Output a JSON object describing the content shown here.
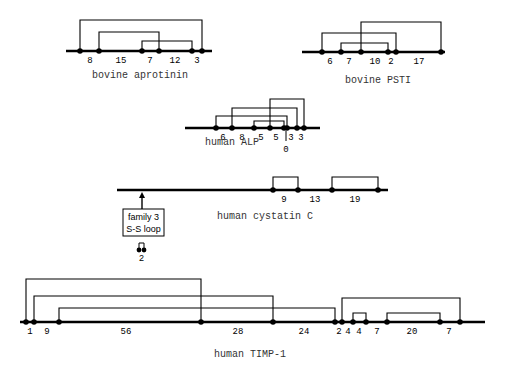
{
  "diagrams": [
    {
      "id": "bovine-aprotinin",
      "label": "bovine aprotinin",
      "line": {
        "x1": 66,
        "x2": 212,
        "y": 51
      },
      "label_pos": {
        "x": 140,
        "y": 78
      },
      "cysteines": [
        80,
        99,
        142,
        159,
        192,
        202
      ],
      "bridges": [
        {
          "from": 80,
          "to": 202,
          "top": 20
        },
        {
          "from": 99,
          "to": 159,
          "top": 32
        },
        {
          "from": 142,
          "to": 192,
          "top": 41
        }
      ],
      "spacings": [
        {
          "text": "8",
          "x": 90
        },
        {
          "text": "15",
          "x": 121
        },
        {
          "text": "7",
          "x": 150
        },
        {
          "text": "12",
          "x": 175
        },
        {
          "text": "3",
          "x": 197
        }
      ]
    },
    {
      "id": "bovine-psti",
      "label": "bovine PSTI",
      "line": {
        "x1": 302,
        "x2": 445,
        "y": 52
      },
      "label_pos": {
        "x": 378,
        "y": 83
      },
      "cysteines": [
        322,
        341,
        361,
        388,
        396,
        441
      ],
      "bridges": [
        {
          "from": 361,
          "to": 441,
          "top": 22
        },
        {
          "from": 322,
          "to": 396,
          "top": 33
        },
        {
          "from": 341,
          "to": 388,
          "top": 43
        }
      ],
      "spacings": [
        {
          "text": "6",
          "x": 330
        },
        {
          "text": "7",
          "x": 349
        },
        {
          "text": "10",
          "x": 375
        },
        {
          "text": "2",
          "x": 391
        },
        {
          "text": "17",
          "x": 419
        }
      ]
    },
    {
      "id": "human-alp",
      "label": "human ALP",
      "line": {
        "x1": 185,
        "x2": 320,
        "y": 128
      },
      "label_pos": {
        "x": 232,
        "y": 145
      },
      "cysteines": [
        216,
        232,
        254,
        270,
        284,
        287,
        297,
        304
      ],
      "bridges": [
        {
          "from": 270,
          "to": 304,
          "top": 99
        },
        {
          "from": 232,
          "to": 297,
          "top": 108
        },
        {
          "from": 216,
          "to": 287,
          "top": 116
        },
        {
          "from": 254,
          "to": 284,
          "top": 121
        }
      ],
      "spacings": [
        {
          "text": "6",
          "x": 223
        },
        {
          "text": "8",
          "x": 242
        },
        {
          "text": "5",
          "x": 261
        },
        {
          "text": "5",
          "x": 276
        },
        {
          "text": "3",
          "x": 291
        },
        {
          "text": "3",
          "x": 301
        }
      ],
      "zero_marker": {
        "text": "0",
        "x": 286,
        "tick_top": 131,
        "tick_bottom": 141,
        "label_y": 152
      }
    },
    {
      "id": "human-cystatin-c",
      "label": "human cystatin C",
      "line": {
        "x1": 117,
        "x2": 388,
        "y": 190
      },
      "label_pos": {
        "x": 265,
        "y": 219
      },
      "cysteines": [
        273,
        298,
        332,
        378
      ],
      "bridges": [
        {
          "from": 273,
          "to": 298,
          "top": 177
        },
        {
          "from": 332,
          "to": 378,
          "top": 177
        }
      ],
      "spacings": [
        {
          "text": "9",
          "x": 284
        },
        {
          "text": "13",
          "x": 315
        },
        {
          "text": "19",
          "x": 355
        }
      ],
      "annotation": {
        "arrow_x": 142,
        "box": {
          "x": 123,
          "y": 209,
          "w": 41,
          "h": 27
        },
        "line1": "family  3",
        "line2": "S-S loop",
        "mini_loop": {
          "x1": 139,
          "x2": 144,
          "top": 243,
          "base": 250
        },
        "mini_label": "2"
      }
    },
    {
      "id": "human-timp-1",
      "label": "human TIMP-1",
      "line": {
        "x1": 20,
        "x2": 485,
        "y": 322
      },
      "label_pos": {
        "x": 250,
        "y": 357
      },
      "cysteines": [
        26,
        34,
        59,
        201,
        273,
        335,
        342,
        353,
        366,
        387,
        440,
        460
      ],
      "bridges": [
        {
          "from": 26,
          "to": 201,
          "top": 279
        },
        {
          "from": 34,
          "to": 273,
          "top": 296
        },
        {
          "from": 59,
          "to": 335,
          "top": 308
        },
        {
          "from": 342,
          "to": 460,
          "top": 298
        },
        {
          "from": 353,
          "to": 366,
          "top": 313
        },
        {
          "from": 387,
          "to": 440,
          "top": 313
        }
      ],
      "spacings": [
        {
          "text": "1",
          "x": 30
        },
        {
          "text": "9",
          "x": 47
        },
        {
          "text": "56",
          "x": 126
        },
        {
          "text": "28",
          "x": 238
        },
        {
          "text": "24",
          "x": 304
        },
        {
          "text": "2",
          "x": 339
        },
        {
          "text": "4",
          "x": 348
        },
        {
          "text": "4",
          "x": 359
        },
        {
          "text": "7",
          "x": 377
        },
        {
          "text": "20",
          "x": 412
        },
        {
          "text": "7",
          "x": 449
        }
      ]
    }
  ],
  "colors": {
    "ink": "#000000",
    "background": "#ffffff",
    "label": "#333333"
  }
}
